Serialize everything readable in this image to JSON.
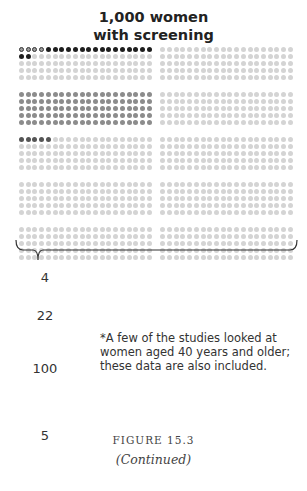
{
  "title": {
    "line1": "1,000 women",
    "line2": "with screening"
  },
  "chart_data": {
    "type": "pictograph",
    "title": "1,000 women with screening",
    "total": 1000,
    "layout": {
      "rows": 25,
      "cols": 40,
      "row_group_size": 5,
      "col_blocks": 2
    },
    "series": [
      {
        "name": "outlined (first group)",
        "count": 4,
        "color": "#8a8a8a",
        "label": "4"
      },
      {
        "name": "black",
        "count": 18,
        "color": "#1e1e1e",
        "label": "22"
      },
      {
        "name": "medium gray",
        "count": 100,
        "color": "#8c8c8c",
        "label": "100"
      },
      {
        "name": "dark gray",
        "count": 5,
        "color": "#555555",
        "label": "5"
      },
      {
        "name": "remaining",
        "count": 873,
        "color": "#d4d4d4"
      }
    ],
    "labels": [
      "4",
      "22",
      "100",
      "5"
    ]
  },
  "labels": {
    "n1": "4",
    "n2": "22",
    "n3": "100",
    "n4": "5"
  },
  "footnote": "*A few of the studies looked at women aged 40 years and older; these data are also included.",
  "caption": {
    "figure": "FIGURE 15.3",
    "continued": "(Continued)"
  },
  "colors": {
    "light": "#d4d4d4",
    "medium": "#8c8c8c",
    "dark": "#555555",
    "black": "#1e1e1e",
    "outlined_fill": "#9a9a9a",
    "outlined_border": "#333333"
  }
}
